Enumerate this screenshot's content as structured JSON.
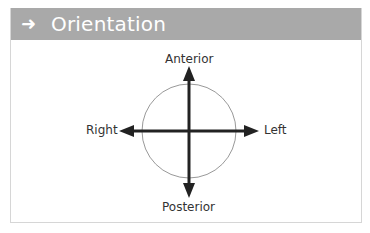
{
  "header": {
    "icon": "arrow-right-icon",
    "icon_glyph": "➜",
    "title": "Orientation",
    "background_color": "#a9a9a9"
  },
  "diagram": {
    "labels": {
      "top": "Anterior",
      "bottom": "Posterior",
      "left": "Right",
      "right": "Left"
    },
    "circle_color": "#999999",
    "arrow_color": "#222222"
  }
}
